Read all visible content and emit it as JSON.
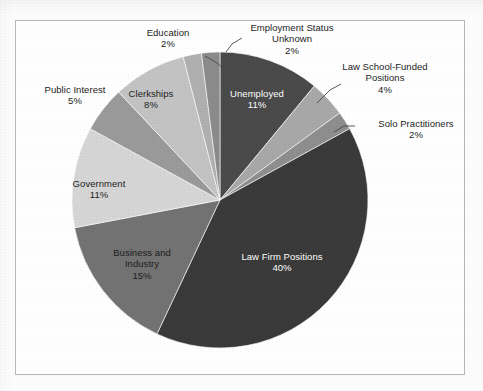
{
  "chart_data": {
    "type": "pie",
    "title": "",
    "subtitle": "",
    "xlabel": "",
    "ylabel": "",
    "legend_position": "none",
    "grid": false,
    "total_percent": 100,
    "start_angle_deg": 0,
    "direction": "clockwise",
    "categories": [
      "Unemployed",
      "Law School-Funded Positions",
      "Solo Practitioners",
      "Law Firm Positions",
      "Business and Industry",
      "Government",
      "Public Interest",
      "Clerkships",
      "Education",
      "Employment Status Unknown"
    ],
    "values": [
      11,
      4,
      2,
      40,
      15,
      11,
      5,
      8,
      2,
      2
    ],
    "value_labels": [
      "11%",
      "4%",
      "2%",
      "40%",
      "15%",
      "11%",
      "5%",
      "8%",
      "2%",
      "2%"
    ],
    "colors": [
      "#4a4a4a",
      "#a8a8a8",
      "#8e8e8e",
      "#3a3a3a",
      "#737373",
      "#d6d6d6",
      "#9a9a9a",
      "#c3c3c3",
      "#b0b0b0",
      "#8b8b8b"
    ],
    "slices": [
      {
        "name": "Unemployed",
        "value": 11,
        "value_label": "11%",
        "color": "#4a4a4a",
        "label_placement": "inside",
        "text_color": "white",
        "leader_line": false
      },
      {
        "name": "Law School-Funded Positions",
        "value": 4,
        "value_label": "4%",
        "color": "#a8a8a8",
        "label_placement": "outside",
        "text_color": "dark",
        "leader_line": true
      },
      {
        "name": "Solo Practitioners",
        "value": 2,
        "value_label": "2%",
        "color": "#8e8e8e",
        "label_placement": "outside",
        "text_color": "dark",
        "leader_line": true
      },
      {
        "name": "Law Firm Positions",
        "value": 40,
        "value_label": "40%",
        "color": "#3a3a3a",
        "label_placement": "inside",
        "text_color": "white",
        "leader_line": false
      },
      {
        "name": "Business and Industry",
        "value": 15,
        "value_label": "15%",
        "color": "#737373",
        "label_placement": "inside",
        "text_color": "dark",
        "leader_line": false
      },
      {
        "name": "Government",
        "value": 11,
        "value_label": "11%",
        "color": "#d6d6d6",
        "label_placement": "inside",
        "text_color": "dark",
        "leader_line": false
      },
      {
        "name": "Public Interest",
        "value": 5,
        "value_label": "5%",
        "color": "#9a9a9a",
        "label_placement": "outside",
        "text_color": "dark",
        "leader_line": false
      },
      {
        "name": "Clerkships",
        "value": 8,
        "value_label": "8%",
        "color": "#c3c3c3",
        "label_placement": "inside",
        "text_color": "dark",
        "leader_line": false
      },
      {
        "name": "Education",
        "value": 2,
        "value_label": "2%",
        "color": "#b0b0b0",
        "label_placement": "outside",
        "text_color": "dark",
        "leader_line": true
      },
      {
        "name": "Employment Status Unknown",
        "value": 2,
        "value_label": "2%",
        "color": "#8b8b8b",
        "label_placement": "outside",
        "text_color": "dark",
        "leader_line": true
      }
    ]
  },
  "labels": {
    "education": {
      "name": "Education",
      "pct": "2%"
    },
    "employment_status_unknown": {
      "name_line1": "Employment Status",
      "name_line2": "Unknown",
      "pct": "2%"
    },
    "law_school_funded": {
      "name_line1": "Law School-Funded",
      "name_line2": "Positions",
      "pct": "4%"
    },
    "solo_practitioners": {
      "name": "Solo Practitioners",
      "pct": "2%"
    },
    "unemployed": {
      "name": "Unemployed",
      "pct": "11%"
    },
    "public_interest": {
      "name": "Public Interest",
      "pct": "5%"
    },
    "clerkships": {
      "name": "Clerkships",
      "pct": "8%"
    },
    "government": {
      "name": "Government",
      "pct": "11%"
    },
    "business_and_industry": {
      "name_line1": "Business and",
      "name_line2": "Industry",
      "pct": "15%"
    },
    "law_firm_positions": {
      "name": "Law Firm Positions",
      "pct": "40%"
    }
  }
}
